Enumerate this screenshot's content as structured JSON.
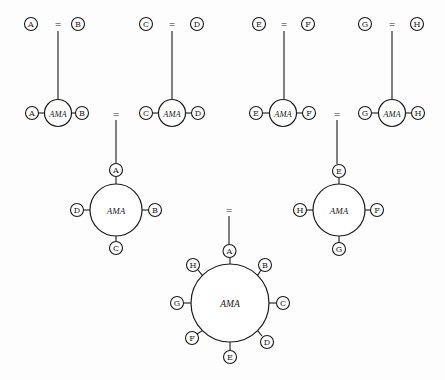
{
  "diagram": {
    "hub_label": "AMA",
    "equals_symbol": "=",
    "stage1_pairs": [
      {
        "left": "A",
        "right": "B",
        "lx": 31,
        "rx": 78,
        "eqx": 58,
        "y": 24
      },
      {
        "left": "C",
        "right": "D",
        "lx": 146,
        "rx": 197,
        "eqx": 172,
        "y": 24
      },
      {
        "left": "E",
        "right": "F",
        "lx": 259,
        "rx": 308,
        "eqx": 284,
        "y": 24
      },
      {
        "left": "G",
        "right": "H",
        "lx": 365,
        "rx": 417,
        "eqx": 392,
        "y": 24
      }
    ],
    "stage2_complexes": [
      {
        "left": "A",
        "right": "B",
        "lx": 32,
        "hx": 58,
        "rx": 82,
        "y": 113
      },
      {
        "left": "C",
        "right": "D",
        "lx": 146,
        "hx": 172,
        "rx": 198,
        "y": 113
      },
      {
        "left": "E",
        "right": "F",
        "lx": 256,
        "hx": 283,
        "rx": 309,
        "y": 113
      },
      {
        "left": "G",
        "right": "H",
        "lx": 365,
        "hx": 392,
        "rx": 418,
        "y": 113
      }
    ],
    "stage2_equals": [
      {
        "x": 116,
        "y": 115
      },
      {
        "x": 337,
        "y": 115
      }
    ],
    "stage3_complexes": [
      {
        "cx": 116,
        "cy": 210,
        "r": 26,
        "top": "A",
        "right": "B",
        "bottom": "C",
        "left": "D"
      },
      {
        "cx": 339,
        "cy": 210,
        "r": 26,
        "top": "E",
        "right": "F",
        "bottom": "G",
        "left": "H"
      }
    ],
    "stage3_equals": {
      "x": 229,
      "y": 210
    },
    "stage4_complex": {
      "cx": 230,
      "cy": 303,
      "r": 39,
      "nodes": [
        "A",
        "B",
        "C",
        "D",
        "E",
        "F",
        "G",
        "H"
      ]
    }
  }
}
